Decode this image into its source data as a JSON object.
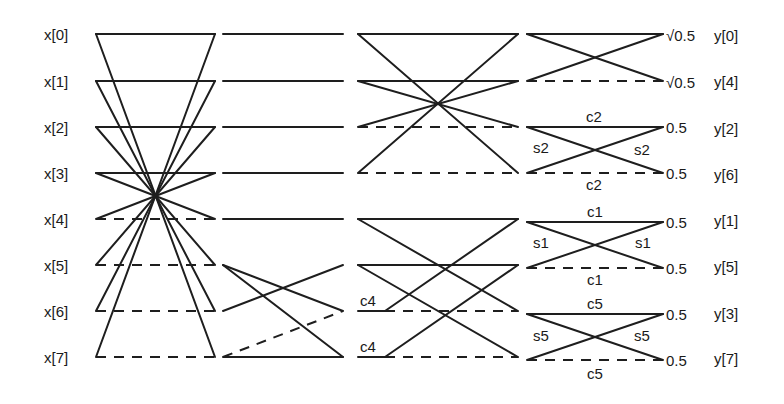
{
  "diagram": {
    "inputs": [
      "x[0]",
      "x[1]",
      "x[2]",
      "x[3]",
      "x[4]",
      "x[5]",
      "x[6]",
      "x[7]"
    ],
    "outputs": [
      "y[0]",
      "y[4]",
      "y[2]",
      "y[6]",
      "y[1]",
      "y[5]",
      "y[3]",
      "y[7]"
    ],
    "scale_factors": [
      "√0.5",
      "√0.5",
      "0.5",
      "0.5",
      "0.5",
      "0.5",
      "0.5",
      "0.5"
    ],
    "stage3_coeffs": [
      "c4",
      "c4"
    ],
    "stage4_coeffs": {
      "pair_2_6": {
        "top": "c2",
        "left": "s2",
        "right": "s2",
        "bottom": "c2"
      },
      "pair_1_5": {
        "top": "c1",
        "left": "s1",
        "right": "s1",
        "bottom": "c1"
      },
      "pair_3_7": {
        "top": "c5",
        "left": "s5",
        "right": "s5",
        "bottom": "c5"
      }
    },
    "legend": {
      "solid": "add (+)",
      "dashed": "subtract (−)"
    }
  }
}
